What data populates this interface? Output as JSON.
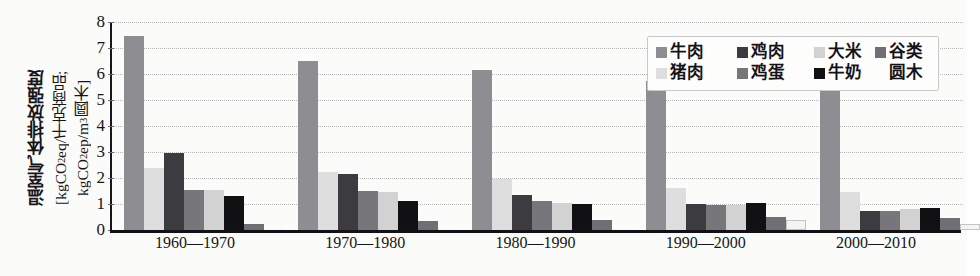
{
  "chart_data": {
    "type": "bar",
    "title": "",
    "xlabel": "",
    "ylabel": "温室气体排放强度 [kgCO2eq/千克商品; kgCO2ep/m3圆木]",
    "ylabel_lines": [
      "温室气体排放强度",
      "[kgCO2eq/千克商品;",
      "kgCO2ep/m3圆木]"
    ],
    "ylim": [
      0,
      8
    ],
    "yticks": [
      0,
      1,
      2,
      3,
      4,
      5,
      6,
      7,
      8
    ],
    "grid": true,
    "legend_position": "top-right",
    "categories": [
      "1960—1970",
      "1970—1980",
      "1980—1990",
      "1990—2000",
      "2000—2010"
    ],
    "series": [
      {
        "name": "牛肉",
        "color": "#8e8e92",
        "values": [
          7.45,
          6.5,
          6.15,
          5.75,
          5.5
        ]
      },
      {
        "name": "猪肉",
        "color": "#dedede",
        "values": [
          2.4,
          2.25,
          1.95,
          1.6,
          1.45
        ]
      },
      {
        "name": "鸡肉",
        "color": "#3b3b40",
        "values": [
          2.95,
          2.15,
          1.35,
          1.0,
          0.75
        ]
      },
      {
        "name": "鸡蛋",
        "color": "#76767b",
        "values": [
          1.55,
          1.5,
          1.1,
          0.95,
          0.72
        ]
      },
      {
        "name": "大米",
        "color": "#d2d2d2",
        "values": [
          1.55,
          1.45,
          1.05,
          0.95,
          0.8
        ]
      },
      {
        "name": "牛奶",
        "color": "#111114",
        "values": [
          1.3,
          1.1,
          1.0,
          1.05,
          0.85
        ]
      },
      {
        "name": "谷类",
        "color": "#6f6f75",
        "values": [
          0.25,
          0.35,
          0.4,
          0.5,
          0.45
        ]
      },
      {
        "name": "圆木",
        "color": "#f4f4f2",
        "values": [
          0,
          0,
          0,
          0.4,
          0.25
        ]
      }
    ]
  },
  "legend": {
    "rows": [
      [
        {
          "label": "牛肉",
          "color": "#8e8e92"
        },
        {
          "label": "鸡肉",
          "color": "#3b3b40"
        },
        {
          "label": "大米",
          "color": "#d2d2d2"
        },
        {
          "label": "谷类",
          "color": "#6f6f75"
        }
      ],
      [
        {
          "label": "猪肉",
          "color": "#dedede"
        },
        {
          "label": "鸡蛋",
          "color": "#76767b"
        },
        {
          "label": "牛奶",
          "color": "#111114"
        },
        {
          "label": "圆木",
          "color": "transparent"
        }
      ]
    ]
  },
  "axis_title": {
    "line1": "温室气体排放强度",
    "line2_pre": "[kgCO",
    "line2_sub": "2",
    "line2_post": "eq/千克商品;",
    "line3_pre": "kgCO",
    "line3_sub": "2",
    "line3_mid": "ep/m",
    "line3_sup": "3",
    "line3_post": "圆木]"
  }
}
